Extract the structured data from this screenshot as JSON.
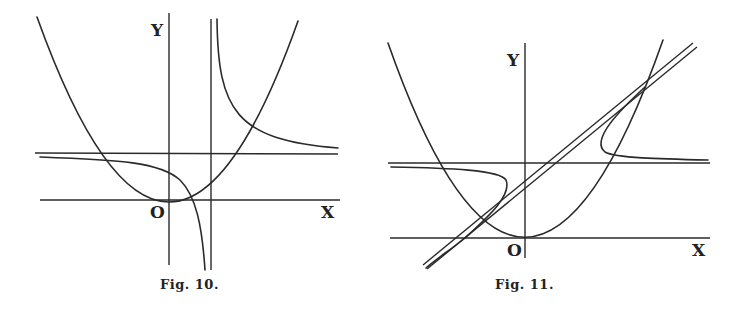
{
  "figures": [
    {
      "id": "fig10",
      "caption": "Fig. 10.",
      "labels": {
        "y_axis": "Y",
        "origin": "O",
        "x_axis": "X"
      },
      "elements": [
        "x-axis",
        "y-axis",
        "parabola",
        "horizontal-asymptote",
        "vertical-asymptote",
        "hyperbola-upper-right-branch",
        "hyperbola-lower-left-branch"
      ]
    },
    {
      "id": "fig11",
      "caption": "Fig. 11.",
      "labels": {
        "y_axis": "Y",
        "origin": "O",
        "x_axis": "X"
      },
      "elements": [
        "x-axis",
        "y-axis",
        "parabola",
        "horizontal-asymptote",
        "oblique-asymptote-double-line",
        "curve-right-branch",
        "curve-left-branch"
      ]
    }
  ]
}
